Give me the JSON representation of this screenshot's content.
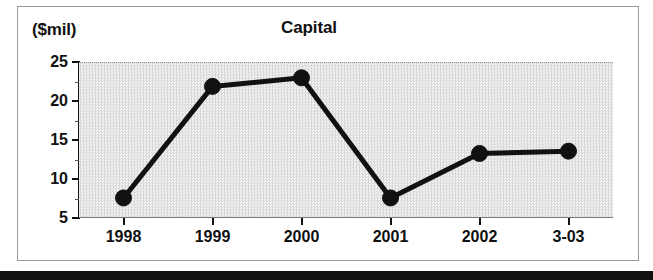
{
  "figure": {
    "unit_label": "($mil)",
    "title": "Capital"
  },
  "chart_data": {
    "type": "line",
    "title": "Capital",
    "subtitle": "",
    "xlabel": "",
    "ylabel": "($mil)",
    "categories": [
      "1998",
      "1999",
      "2000",
      "2001",
      "2002",
      "3-03"
    ],
    "values": [
      7.7,
      22.0,
      23.1,
      7.7,
      13.4,
      13.7
    ],
    "series": [
      {
        "name": "Capital",
        "values": [
          7.7,
          22.0,
          23.1,
          7.7,
          13.4,
          13.7
        ]
      }
    ],
    "ylim": [
      5,
      25
    ],
    "yticks": [
      5,
      10,
      15,
      20,
      25
    ],
    "ytick_labels": [
      "5",
      "10",
      "15",
      "20",
      "25"
    ],
    "xtick_labels": [
      "1998",
      "1999",
      "2000",
      "2001",
      "2002",
      "3-03"
    ],
    "grid": false,
    "legend": "none",
    "marker": "filled-circle",
    "line_color": "#111111",
    "plot_background": "#e8e8e8"
  }
}
